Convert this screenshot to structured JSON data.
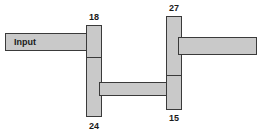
{
  "diagram": {
    "background_color": "#ffffff",
    "fill_color": "#c9c9c9",
    "stroke_color": "#3a3a3a",
    "text_color": "#1a1a1a",
    "input_label": "Input",
    "labels": {
      "top_left": "18",
      "bottom_left": "24",
      "top_right": "27",
      "bottom_right": "15"
    },
    "blocks": [
      {
        "name": "input-beam",
        "text": "Input",
        "x": 5,
        "y": 33,
        "w": 88,
        "h": 18
      },
      {
        "name": "left-column",
        "text": "",
        "x": 86,
        "y": 25,
        "w": 16,
        "h": 92
      },
      {
        "name": "middle-beam",
        "text": "",
        "x": 99,
        "y": 82,
        "w": 70,
        "h": 14
      },
      {
        "name": "right-column",
        "text": "",
        "x": 166,
        "y": 16,
        "w": 16,
        "h": 94
      },
      {
        "name": "output-beam",
        "text": "",
        "x": 178,
        "y": 37,
        "w": 79,
        "h": 18
      }
    ]
  }
}
